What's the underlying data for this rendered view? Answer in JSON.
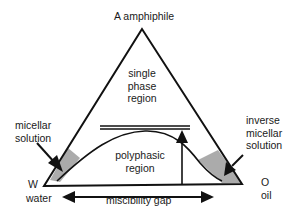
{
  "diagram": {
    "type": "ternary-phase-diagram",
    "vertices": {
      "top": {
        "symbol": "A",
        "name": "amphiphile",
        "label": "A amphiphile"
      },
      "left": {
        "symbol": "W",
        "name": "water"
      },
      "right": {
        "symbol": "O",
        "name": "oil"
      }
    },
    "regions": {
      "single_phase": [
        "single",
        "phase",
        "region"
      ],
      "polyphasic": [
        "polyphasic",
        "region"
      ]
    },
    "annotations": {
      "micellar": [
        "micellar",
        "solution"
      ],
      "inverse_micellar": [
        "inverse",
        "micellar",
        "solution"
      ],
      "miscibility_gap": "miscibility gap"
    },
    "colors": {
      "line": "#111111",
      "shade": "#9a9a9a"
    }
  }
}
